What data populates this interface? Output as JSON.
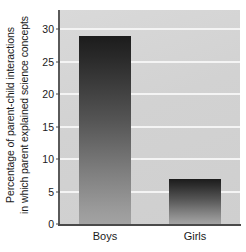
{
  "chart_data": {
    "type": "bar",
    "title": "",
    "subtitle": "",
    "categories": [
      "Boys",
      "Girls"
    ],
    "values": [
      29,
      7
    ],
    "series": [
      {
        "name": "Percentage of parent-child interactions in which parent explained science concepts",
        "values": [
          29,
          7
        ]
      }
    ],
    "xlabel": "",
    "ylabel_line1": "Percentage of parent-child interactions",
    "ylabel_line2": "in which parent explained science concepts",
    "ylim": [
      0,
      33
    ],
    "yticks": [
      0,
      5,
      10,
      15,
      20,
      25,
      30
    ],
    "ytick_labels": [
      "0",
      "5",
      "10",
      "15",
      "20",
      "25",
      "30"
    ],
    "grid": true,
    "gridline_color": "#f4f4f4",
    "plot_background": "#d4d4d4",
    "bar_color_top": "#1c1c1c",
    "bar_color_bottom": "#a3a3a3",
    "axis_color": "#4a4a4a",
    "legend": null,
    "legend_position": "none"
  }
}
